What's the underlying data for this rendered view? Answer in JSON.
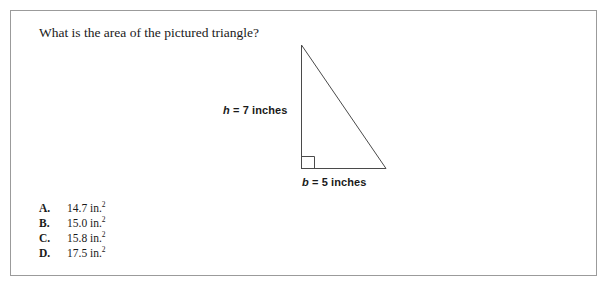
{
  "question": {
    "text": "What is the area of the pictured triangle?"
  },
  "figure": {
    "shape": "right-triangle",
    "height_label": {
      "variable": "h",
      "equals": "=",
      "value": "7",
      "unit": "inches",
      "full": "h = 7 inches"
    },
    "base_label": {
      "variable": "b",
      "equals": "=",
      "value": "5",
      "unit": "inches",
      "full": "b = 5 inches"
    },
    "right_angle_marker": true,
    "line_color": "#4a4a4a"
  },
  "answers": [
    {
      "letter": "A.",
      "value": "14.7 in.",
      "exponent": "2"
    },
    {
      "letter": "B.",
      "value": "15.0 in.",
      "exponent": "2"
    },
    {
      "letter": "C.",
      "value": "15.8 in.",
      "exponent": "2"
    },
    {
      "letter": "D.",
      "value": "17.5 in.",
      "exponent": "2"
    }
  ],
  "colors": {
    "frame_border": "#9b9b9b",
    "text": "#1a1a1a",
    "background": "#ffffff"
  }
}
